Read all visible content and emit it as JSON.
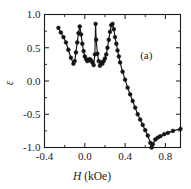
{
  "chart_data": {
    "type": "line",
    "title": "",
    "subtitle": "",
    "xlabel": "H (kOe)",
    "xlabel_symbol": "H",
    "xlabel_unit": "(kOe)",
    "ylabel": "ε",
    "xlim": [
      -0.4,
      0.95
    ],
    "ylim": [
      -1.0,
      1.0
    ],
    "xticks": [
      -0.4,
      0.0,
      0.4,
      0.8
    ],
    "xticklabels": [
      "-0.4",
      "0.0",
      "0.4",
      "0.8"
    ],
    "xminorticks": [
      -0.2,
      0.2,
      0.6
    ],
    "yticks": [
      1.0,
      0.5,
      0.0,
      -0.5,
      -1.0
    ],
    "yticklabels": [
      "1.0",
      "0.5",
      "0.0",
      "-0.5",
      "-1.0"
    ],
    "yminorticks": [
      0.75,
      0.25,
      -0.25,
      -0.75
    ],
    "grid": false,
    "legend": null,
    "annotations": [
      {
        "text": "(a)",
        "x": 0.55,
        "y": 0.33
      }
    ],
    "marker": "circle-filled",
    "line_color": "#141414",
    "marker_color": "#141414",
    "series": [
      {
        "name": "epsilon vs H",
        "x": [
          -0.262,
          -0.238,
          -0.212,
          -0.187,
          -0.163,
          -0.138,
          -0.113,
          -0.1,
          -0.088,
          -0.075,
          -0.063,
          -0.05,
          -0.037,
          -0.025,
          -0.012,
          0.0,
          0.013,
          0.025,
          0.038,
          0.05,
          0.063,
          0.075,
          0.088,
          0.1,
          0.107,
          0.113,
          0.125,
          0.138,
          0.15,
          0.163,
          0.175,
          0.188,
          0.2,
          0.213,
          0.225,
          0.238,
          0.25,
          0.263,
          0.275,
          0.288,
          0.3,
          0.313,
          0.325,
          0.338,
          0.35,
          0.375,
          0.4,
          0.425,
          0.45,
          0.475,
          0.5,
          0.525,
          0.55,
          0.575,
          0.6,
          0.625,
          0.65,
          0.663,
          0.675,
          0.7,
          0.725,
          0.75,
          0.788,
          0.825,
          0.875,
          0.95
        ],
        "y": [
          0.8,
          0.73,
          0.66,
          0.58,
          0.47,
          0.35,
          0.26,
          0.3,
          0.43,
          0.58,
          0.72,
          0.82,
          0.7,
          0.56,
          0.45,
          0.37,
          0.33,
          0.3,
          0.31,
          0.33,
          0.31,
          0.28,
          0.24,
          0.4,
          0.86,
          0.62,
          0.41,
          0.3,
          0.23,
          0.28,
          0.26,
          0.3,
          0.34,
          0.4,
          0.5,
          0.62,
          0.74,
          0.84,
          0.86,
          0.78,
          0.66,
          0.56,
          0.46,
          0.37,
          0.28,
          0.14,
          0.02,
          -0.1,
          -0.2,
          -0.3,
          -0.4,
          -0.5,
          -0.58,
          -0.66,
          -0.74,
          -0.82,
          -0.93,
          -1.0,
          -0.95,
          -0.88,
          -0.85,
          -0.83,
          -0.8,
          -0.78,
          -0.75,
          -0.72
        ]
      }
    ]
  },
  "figure": {
    "panel_label": "(a)",
    "x_axis_title_symbol": "H",
    "x_axis_title_unit": "(kOe)",
    "y_axis_title": "ε"
  }
}
